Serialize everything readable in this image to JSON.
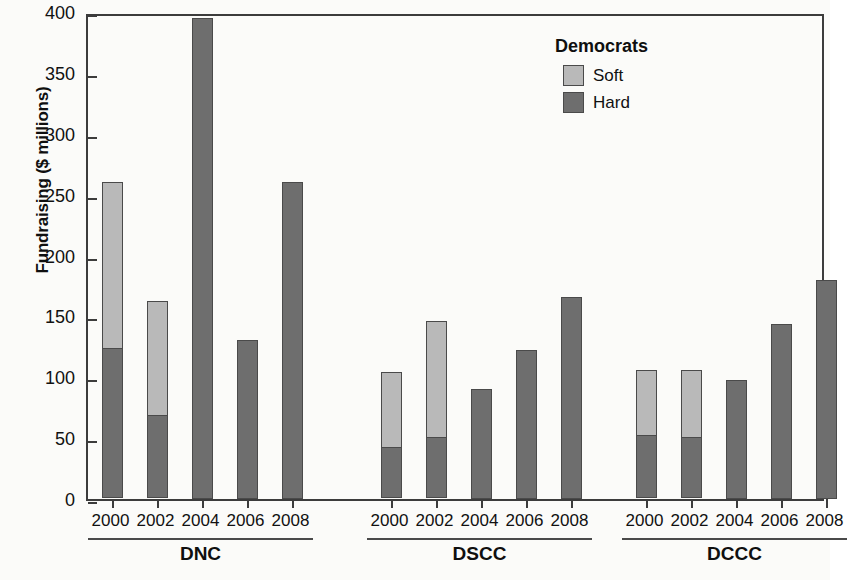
{
  "chart_data": {
    "type": "bar",
    "title": "",
    "xlabel": "",
    "ylabel": "Fundraising ($ millions)",
    "ylim": [
      0,
      400
    ],
    "yticks": [
      0,
      50,
      100,
      150,
      200,
      250,
      300,
      350,
      400
    ],
    "grid": false,
    "stacked": true,
    "legend": {
      "title": "Democrats",
      "position": "top-right",
      "entries": [
        {
          "name": "Soft",
          "color": "#b9b9b9"
        },
        {
          "name": "Hard",
          "color": "#6e6e6e"
        }
      ]
    },
    "series": [
      {
        "name": "Hard",
        "color": "#6e6e6e"
      },
      {
        "name": "Soft",
        "color": "#b9b9b9"
      }
    ],
    "categories": [
      "2000",
      "2002",
      "2004",
      "2006",
      "2008"
    ],
    "groups": [
      {
        "name": "DNC",
        "bars": [
          {
            "x": "2000",
            "hard": 123,
            "soft": 137,
            "total": 260
          },
          {
            "x": "2002",
            "hard": 68,
            "soft": 95,
            "total": 163
          },
          {
            "x": "2004",
            "hard": 395,
            "soft": 0,
            "total": 395
          },
          {
            "x": "2006",
            "hard": 131,
            "soft": 0,
            "total": 131
          },
          {
            "x": "2008",
            "hard": 260,
            "soft": 0,
            "total": 260
          }
        ]
      },
      {
        "name": "DSCC",
        "bars": [
          {
            "x": "2000",
            "hard": 42,
            "soft": 62,
            "total": 104
          },
          {
            "x": "2002",
            "hard": 50,
            "soft": 96,
            "total": 146
          },
          {
            "x": "2004",
            "hard": 90,
            "soft": 0,
            "total": 90
          },
          {
            "x": "2006",
            "hard": 122,
            "soft": 0,
            "total": 122
          },
          {
            "x": "2008",
            "hard": 166,
            "soft": 0,
            "total": 166
          }
        ]
      },
      {
        "name": "DCCC",
        "bars": [
          {
            "x": "2000",
            "hard": 52,
            "soft": 54,
            "total": 106
          },
          {
            "x": "2002",
            "hard": 50,
            "soft": 56,
            "total": 106
          },
          {
            "x": "2004",
            "hard": 98,
            "soft": 0,
            "total": 98
          },
          {
            "x": "2006",
            "hard": 144,
            "soft": 0,
            "total": 144
          },
          {
            "x": "2008",
            "hard": 180,
            "soft": 0,
            "total": 180
          }
        ]
      }
    ]
  }
}
